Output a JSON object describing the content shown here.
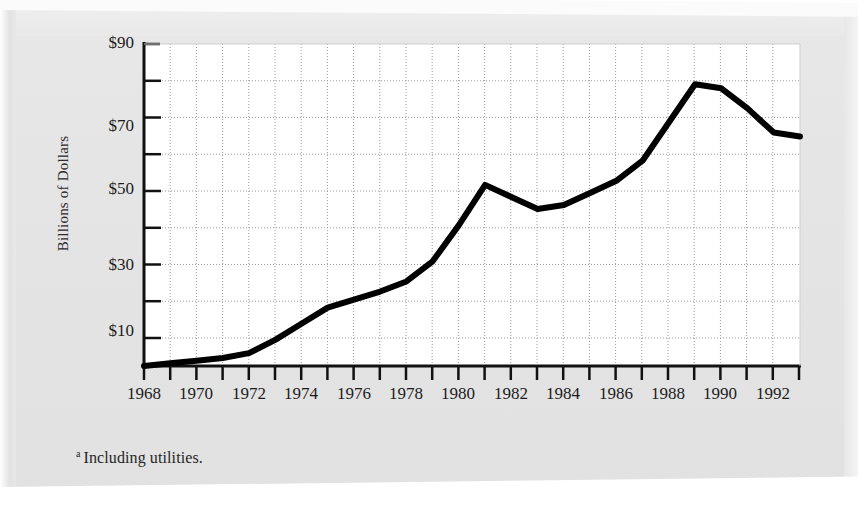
{
  "figure": {
    "ylabel": "Billions of Dollars",
    "footnote_marker": "a",
    "footnote_text": "Including utilities.",
    "y_tick_labels": [
      "$90",
      "$70",
      "$50",
      "$30",
      "$10"
    ],
    "x_tick_labels": [
      "1968",
      "1970",
      "1972",
      "1974",
      "1976",
      "1978",
      "1980",
      "1982",
      "1984",
      "1986",
      "1988",
      "1990",
      "1992"
    ],
    "line_color": "#000000",
    "grid_color": "#a8a8a8",
    "axis_color": "#111111",
    "plot_background": "#ffffff",
    "paper_color": "#e6e6e6"
  },
  "chart_data": {
    "type": "line",
    "title": "",
    "xlabel": "",
    "ylabel": "Billions of Dollars",
    "xlim": [
      1968,
      1993
    ],
    "ylim": [
      10,
      90
    ],
    "ytick_values": [
      10,
      20,
      30,
      40,
      50,
      60,
      70,
      80,
      90
    ],
    "ytick_labeled": [
      10,
      30,
      50,
      70,
      90
    ],
    "xtick_values": [
      1968,
      1969,
      1970,
      1971,
      1972,
      1973,
      1974,
      1975,
      1976,
      1977,
      1978,
      1979,
      1980,
      1981,
      1982,
      1983,
      1984,
      1985,
      1986,
      1987,
      1988,
      1989,
      1990,
      1991,
      1992,
      1993
    ],
    "xtick_labeled": [
      1968,
      1970,
      1972,
      1974,
      1976,
      1978,
      1980,
      1982,
      1984,
      1986,
      1988,
      1990,
      1992
    ],
    "grid": true,
    "legend": "none",
    "x": [
      1968,
      1969,
      1970,
      1971,
      1972,
      1973,
      1974,
      1975,
      1976,
      1977,
      1978,
      1979,
      1980,
      1981,
      1982,
      1983,
      1984,
      1985,
      1986,
      1987,
      1988,
      1989,
      1990,
      1991,
      1992,
      1993
    ],
    "values": [
      10.0,
      10.7,
      11.3,
      12.0,
      13.2,
      16.5,
      20.5,
      24.5,
      26.5,
      28.5,
      31.0,
      36.0,
      45.0,
      55.0,
      52.0,
      49.0,
      50.0,
      53.0,
      56.0,
      61.0,
      70.5,
      80.0,
      79.0,
      74.0,
      68.0,
      67.0
    ],
    "annotations": [
      "a Including utilities."
    ]
  }
}
